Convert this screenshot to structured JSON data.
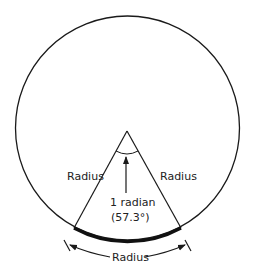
{
  "diagram": {
    "labels": {
      "left_radius": "Radius",
      "right_radius": "Radius",
      "bottom_radius": "Radius",
      "angle_line1": "1 radian",
      "angle_line2": "(57.3°)"
    },
    "colors": {
      "stroke": "#1a1a1a",
      "background": "#ffffff"
    }
  }
}
